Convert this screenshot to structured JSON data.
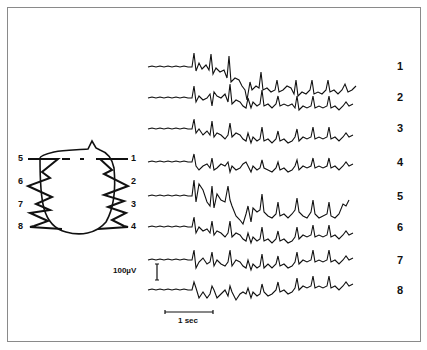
{
  "figure": {
    "channels": [
      {
        "label": "1",
        "y": 67
      },
      {
        "label": "2",
        "y": 98
      },
      {
        "label": "3",
        "y": 129
      },
      {
        "label": "4",
        "y": 162
      },
      {
        "label": "5",
        "y": 196
      },
      {
        "label": "6",
        "y": 227
      },
      {
        "label": "7",
        "y": 260
      },
      {
        "label": "8",
        "y": 290
      }
    ],
    "montage_labels": {
      "left": [
        "5",
        "6",
        "7",
        "8"
      ],
      "right": [
        "1",
        "2",
        "3",
        "4"
      ]
    },
    "amplitude_scale": "100µV",
    "time_scale": "1 sec",
    "colors": {
      "ink": "#111111",
      "frame": "#8a8a8a",
      "background": "#ffffff"
    }
  }
}
